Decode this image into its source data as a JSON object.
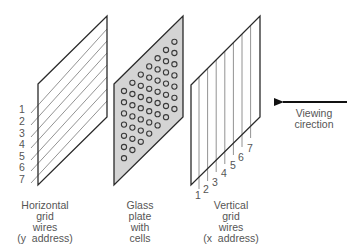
{
  "diagram": {
    "panels": {
      "horizontal": {
        "caption": [
          "Horizontal",
          "grid",
          "wires",
          "(y  address)"
        ],
        "wire_labels": [
          "1",
          "2",
          "3",
          "4",
          "5",
          "6",
          "7"
        ]
      },
      "glass": {
        "caption": [
          "Glass",
          "plate",
          "with",
          "cells"
        ],
        "cell_grid": {
          "columns": 7,
          "rows": 7
        }
      },
      "vertical": {
        "caption": [
          "Vertical",
          "grid",
          "wires",
          "(x  address)"
        ],
        "wire_labels": [
          "1",
          "2",
          "3",
          "4",
          "5",
          "6",
          "7"
        ]
      }
    },
    "viewing": {
      "label_line1": "Viewing",
      "label_line2": "cirection",
      "arrow_direction": "left"
    },
    "colors": {
      "outline": "#2a2a2a",
      "wire": "#777777",
      "glass_fill": "#d4d4d4",
      "text": "#555555",
      "arrow": "#111111"
    }
  }
}
